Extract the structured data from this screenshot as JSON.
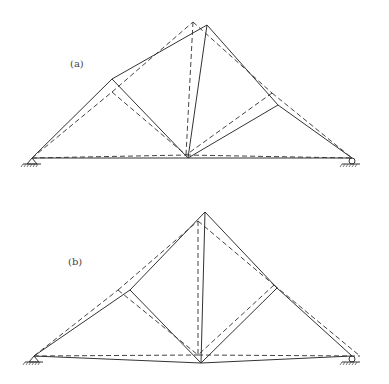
{
  "figure": {
    "panels": [
      {
        "id": "a",
        "label": "(a)",
        "label_pos": [
          70,
          58
        ],
        "supports": {
          "left": {
            "type": "pin",
            "x": 32,
            "y": 158
          },
          "right": {
            "type": "roller",
            "x": 352,
            "y": 158
          }
        },
        "solid_nodes": {
          "L": [
            32,
            158
          ],
          "P1": [
            112,
            79
          ],
          "A": [
            207,
            25
          ],
          "P2": [
            278,
            105
          ],
          "R": [
            352,
            158
          ],
          "C": [
            188,
            158
          ]
        },
        "dashed_nodes": {
          "L": [
            32,
            158
          ],
          "P1": [
            112,
            92
          ],
          "A": [
            193,
            22
          ],
          "P2": [
            272,
            93
          ],
          "R": [
            352,
            158
          ],
          "C": [
            186,
            155
          ]
        }
      },
      {
        "id": "b",
        "label": "(b)",
        "label_pos": [
          68,
          256
        ],
        "supports": {
          "left": {
            "type": "pin",
            "x": 34,
            "y": 356
          },
          "right": {
            "type": "roller",
            "x": 352,
            "y": 356
          }
        },
        "solid_nodes": {
          "L": [
            34,
            356
          ],
          "P1": [
            130,
            290
          ],
          "A": [
            205,
            212
          ],
          "P2": [
            277,
            288
          ],
          "R": [
            352,
            356
          ],
          "C": [
            201,
            363
          ]
        },
        "dashed_nodes": {
          "L": [
            34,
            356
          ],
          "P1": [
            118,
            290
          ],
          "A": [
            198,
            221
          ],
          "P2": [
            274,
            285
          ],
          "R": [
            360,
            356
          ],
          "C": [
            198,
            355
          ]
        }
      }
    ],
    "legend": {
      "solid": "deformed shape",
      "dashed": "undeformed / alternate shape"
    },
    "caption": ""
  }
}
